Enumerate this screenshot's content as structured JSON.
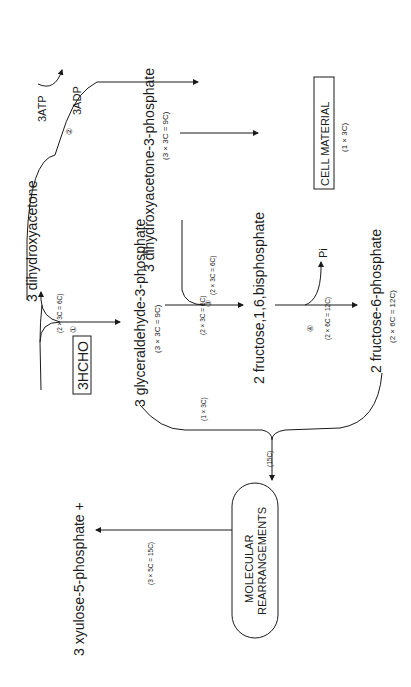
{
  "diagram": {
    "title": "",
    "orientation": "rotated-90-ccw",
    "nodes": {
      "dihydroxyacetone": "3 dihydroxyacetone",
      "xylulose": "3 xyulose-5-phosphate +",
      "hcho": "3HCHO",
      "gap": "3 glyceraldehyde-3-phosphate",
      "gap_count": "(3 × 3C = 9C)",
      "dhap": "3 dihydroxyacetone-3-phosphate",
      "dhap_count": "(3 × 3C = 9C)",
      "fbp": "2 fructose,1,6,bisphosphate",
      "f6p": "2 fructose-6-phosphate",
      "f6p_count": "(2 × 6C = 12C)",
      "cell_material": "CELL MATERIAL",
      "cell_material_count": "(1 × 3C)",
      "molecular_line1": "MOLECULAR",
      "molecular_line2": "REARRANGEMENTS"
    },
    "labels": {
      "atp": "3ATP",
      "adp": "3ADP",
      "pi": "Pi",
      "step1": "①",
      "step2": "②",
      "step3": "③",
      "step4": "④",
      "split_count": "(2 × 3C = 6C)",
      "gap_to_fbp_count": "(2 × 3C = 6C)",
      "dhap_to_fbp_count": "(2 × 3C = 6C)",
      "fbp_to_f6p_count": "(2 × 6C = 12C)",
      "gap_branch_count": "(1 × 3C)",
      "merge_count": "(15C)",
      "xylulose_count": "(3 × 5C = 15C)"
    },
    "colors": {
      "line": "#1a1a1a",
      "background": "#ffffff"
    }
  }
}
